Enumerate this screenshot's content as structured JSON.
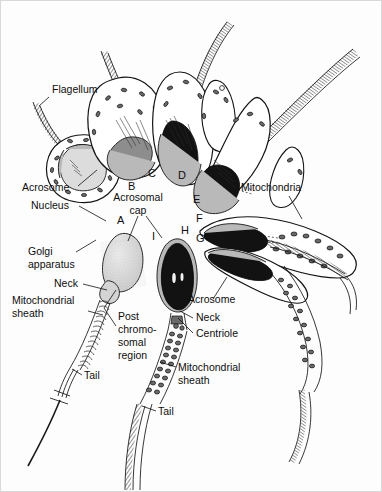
{
  "figure": {
    "width": 382,
    "height": 492,
    "background": "#fdfdfd",
    "ink_color": "#121212"
  },
  "stage_labels": [
    {
      "id": "A",
      "text": "A",
      "x": 117,
      "y": 224
    },
    {
      "id": "B",
      "text": "B",
      "x": 128,
      "y": 190
    },
    {
      "id": "C",
      "text": "C",
      "x": 148,
      "y": 177
    },
    {
      "id": "D",
      "text": "D",
      "x": 178,
      "y": 179
    },
    {
      "id": "E",
      "text": "E",
      "x": 193,
      "y": 203
    },
    {
      "id": "F",
      "text": "F",
      "x": 196,
      "y": 222
    },
    {
      "id": "G",
      "text": "G",
      "x": 196,
      "y": 242
    },
    {
      "id": "H",
      "text": "H",
      "x": 181,
      "y": 234
    },
    {
      "id": "I",
      "text": "I",
      "x": 152,
      "y": 240
    }
  ],
  "annotations": [
    {
      "name": "flagellum",
      "lines": [
        "Flagellum"
      ],
      "x": 52,
      "y": 93,
      "anchor": "start",
      "leader": "M 49 97 L 39 106"
    },
    {
      "name": "acrosome-left",
      "lines": [
        "Acrosome"
      ],
      "x": 22,
      "y": 191,
      "anchor": "start",
      "leader": "M 78 186 L 97 170"
    },
    {
      "name": "nucleus",
      "lines": [
        "Nucleus"
      ],
      "x": 31,
      "y": 209,
      "anchor": "start",
      "leader": "M 79 206 L 106 221"
    },
    {
      "name": "golgi-apparatus",
      "lines": [
        "Golgi",
        "apparatus"
      ],
      "x": 28,
      "y": 255,
      "anchor": "start",
      "leader": "M 76 252 L 96 240"
    },
    {
      "name": "neck-left",
      "lines": [
        "Neck"
      ],
      "x": 54,
      "y": 287,
      "anchor": "start",
      "leader": "M 83 284 L 107 290"
    },
    {
      "name": "mitochondrial-sheath-left",
      "lines": [
        "Mitochondrial",
        "sheath"
      ],
      "x": 12,
      "y": 304,
      "anchor": "start",
      "leader": "M 88 311 L 103 315"
    },
    {
      "name": "tail-left",
      "lines": [
        "Tail"
      ],
      "x": 84,
      "y": 379,
      "anchor": "start",
      "leader": "M 82 375 L 72 369"
    },
    {
      "name": "acrosomal-cap",
      "lines": [
        "Acrosomal",
        "cap"
      ],
      "x": 138,
      "y": 201,
      "anchor": "middle",
      "leader": "M 138 216 L 128 241 M 146 216 L 162 238"
    },
    {
      "name": "post-chromosomal-region",
      "lines": [
        "Post",
        "chromo-",
        "somal",
        "region"
      ],
      "x": 118,
      "y": 320,
      "anchor": "start",
      "leader": "M 116 326 L 104 308 L 116 290"
    },
    {
      "name": "mitochondria",
      "lines": [
        "Mitochondria"
      ],
      "x": 241,
      "y": 191,
      "anchor": "start",
      "leader": "M 289 196 L 302 219"
    },
    {
      "name": "acrosome-right",
      "lines": [
        "Acrosome"
      ],
      "x": 188,
      "y": 303,
      "anchor": "start",
      "leader": "M 213 299 L 227 277"
    },
    {
      "name": "neck-right",
      "lines": [
        "Neck"
      ],
      "x": 196,
      "y": 321,
      "anchor": "start",
      "leader": "M 193 318 L 180 311"
    },
    {
      "name": "centriole",
      "lines": [
        "Centriole"
      ],
      "x": 196,
      "y": 337,
      "anchor": "start",
      "leader": "M 193 333 L 178 318"
    },
    {
      "name": "mitochondrial-sheath-right",
      "lines": [
        "Mitochondrial",
        "sheath"
      ],
      "x": 178,
      "y": 371,
      "anchor": "start",
      "leader": "M 176 367 L 160 362"
    },
    {
      "name": "tail-right",
      "lines": [
        "Tail"
      ],
      "x": 158,
      "y": 415,
      "anchor": "start",
      "leader": "M 156 411 L 142 406"
    }
  ],
  "structures": {
    "cell_a": {
      "label": "Stage A spermatid - round cell with Golgi apparatus and pale nucleus"
    },
    "cell_b": {
      "label": "Stage B spermatid - acrosomal granule contacting nucleus"
    },
    "cell_c": {
      "label": "Stage C spermatid - acrosomal cap spreading over nucleus"
    },
    "cell_d": {
      "label": "Stage D spermatid - elongating nucleus condensing"
    },
    "cell_e": {
      "label": "Stage E spermatid - nucleus condensed and dark"
    },
    "cell_f": {
      "label": "Stage F spermatid - elongated head with mitochondria migrating"
    },
    "cell_g": {
      "label": "Stage G spermatozoon - mitochondrial sheath forming around midpiece"
    },
    "cell_h": {
      "label": "Stage H spermatozoon - mature dark head with mitochondrial sheath"
    },
    "cell_i": {
      "label": "Stage I spermatozoon - pale mature form with post chromosomal region"
    }
  }
}
